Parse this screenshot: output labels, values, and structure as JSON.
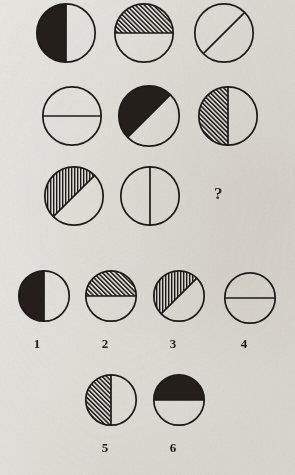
{
  "puzzle": {
    "title": "Circle halves matrix reasoning puzzle",
    "background_color": "#e9e7e2",
    "ink_color": "#1d1b18",
    "question_mark": "?",
    "matrix": {
      "rows": 3,
      "columns": 3,
      "items": [
        {
          "id": "matrix-1-1",
          "position": "row1-col1",
          "divider": "vertical",
          "filled_side": "left",
          "fill": "solid",
          "description": "circle split vertically, left half solid black"
        },
        {
          "id": "matrix-1-2",
          "position": "row1-col2",
          "divider": "horizontal",
          "filled_side": "top",
          "fill": "diagonal-hatch",
          "description": "circle split horizontally, top half diagonally hatched"
        },
        {
          "id": "matrix-1-3",
          "position": "row1-col3",
          "divider": "diagonal",
          "filled_side": "none",
          "fill": "none",
          "description": "circle split by diagonal line, both halves empty"
        },
        {
          "id": "matrix-2-1",
          "position": "row2-col1",
          "divider": "horizontal",
          "filled_side": "none",
          "fill": "none",
          "description": "circle split horizontally, both halves empty"
        },
        {
          "id": "matrix-2-2",
          "position": "row2-col2",
          "divider": "diagonal",
          "filled_side": "upper-left",
          "fill": "solid",
          "description": "circle split diagonally, upper-left half solid black"
        },
        {
          "id": "matrix-2-3",
          "position": "row2-col3",
          "divider": "vertical",
          "filled_side": "left",
          "fill": "diagonal-hatch",
          "description": "circle split vertically, left half diagonally hatched"
        },
        {
          "id": "matrix-3-1",
          "position": "row3-col1",
          "divider": "diagonal",
          "filled_side": "upper-left",
          "fill": "vertical-hatch",
          "description": "circle split diagonally, upper-left half vertically hatched"
        },
        {
          "id": "matrix-3-2",
          "position": "row3-col2",
          "divider": "vertical",
          "filled_side": "none",
          "fill": "none",
          "description": "circle split vertically, both halves empty"
        },
        {
          "id": "matrix-3-3",
          "position": "row3-col3",
          "divider": "none",
          "filled_side": "none",
          "fill": "question",
          "description": "missing element shown as a question mark"
        }
      ]
    },
    "options": [
      {
        "id": "option-1",
        "label": "1",
        "divider": "vertical",
        "filled_side": "left",
        "fill": "solid",
        "description": "circle split vertically, left half solid black"
      },
      {
        "id": "option-2",
        "label": "2",
        "divider": "horizontal",
        "filled_side": "top",
        "fill": "diagonal-hatch",
        "description": "circle split horizontally, top half diagonally hatched"
      },
      {
        "id": "option-3",
        "label": "3",
        "divider": "diagonal",
        "filled_side": "upper-left",
        "fill": "vertical-hatch",
        "description": "circle split diagonally, upper-left half vertically hatched"
      },
      {
        "id": "option-4",
        "label": "4",
        "divider": "horizontal",
        "filled_side": "none",
        "fill": "none",
        "description": "circle split horizontally, both halves empty"
      },
      {
        "id": "option-5",
        "label": "5",
        "divider": "vertical",
        "filled_side": "left",
        "fill": "diagonal-hatch",
        "description": "circle split vertically, left half diagonally hatched"
      },
      {
        "id": "option-6",
        "label": "6",
        "divider": "horizontal",
        "filled_side": "top",
        "fill": "solid",
        "description": "circle split horizontally, top half solid black"
      }
    ]
  },
  "layout": {
    "matrix_positions": [
      {
        "x": 36,
        "y": 3,
        "size": 60
      },
      {
        "x": 114,
        "y": 3,
        "size": 60
      },
      {
        "x": 194,
        "y": 3,
        "size": 60
      },
      {
        "x": 42,
        "y": 86,
        "size": 60
      },
      {
        "x": 118,
        "y": 85,
        "size": 62
      },
      {
        "x": 198,
        "y": 86,
        "size": 60
      },
      {
        "x": 44,
        "y": 166,
        "size": 60
      },
      {
        "x": 120,
        "y": 166,
        "size": 60
      }
    ],
    "question_position": {
      "x": 214,
      "y": 184
    },
    "option_positions": [
      {
        "x": 18,
        "y": 270,
        "size": 52,
        "label_x": 27,
        "label_y": 336
      },
      {
        "x": 85,
        "y": 270,
        "size": 52,
        "label_x": 95,
        "label_y": 336
      },
      {
        "x": 153,
        "y": 270,
        "size": 52,
        "label_x": 163,
        "label_y": 336
      },
      {
        "x": 224,
        "y": 272,
        "size": 52,
        "label_x": 234,
        "label_y": 336
      },
      {
        "x": 85,
        "y": 374,
        "size": 52,
        "label_x": 95,
        "label_y": 440
      },
      {
        "x": 153,
        "y": 374,
        "size": 52,
        "label_x": 163,
        "label_y": 440
      }
    ]
  }
}
